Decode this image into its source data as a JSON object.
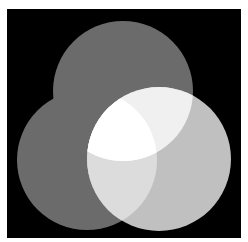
{
  "diagram": {
    "type": "venn",
    "set_count": 3,
    "background": {
      "x": 7,
      "y": 9,
      "width": 234,
      "height": 229,
      "color": "#000000"
    },
    "circles": [
      {
        "id": "top",
        "cx": 123,
        "cy": 91,
        "r": 70,
        "color": "#6b6b6b"
      },
      {
        "id": "left",
        "cx": 87,
        "cy": 160,
        "r": 70,
        "color": "#6b6b6b"
      },
      {
        "id": "right",
        "cx": 159,
        "cy": 159,
        "r": 72,
        "color": "#c0c0c0"
      }
    ],
    "overlaps": {
      "top_left": "#6b6b6b",
      "top_right": "#f0f0f0",
      "left_right": "#dcdcdc",
      "top_left_right": "#ffffff"
    },
    "page_background": "#ffffff"
  }
}
